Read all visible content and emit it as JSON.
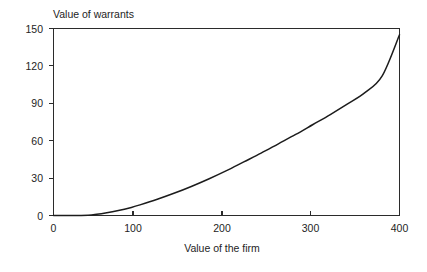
{
  "chart_data": {
    "type": "line",
    "title": "Value of warrants",
    "xlabel": "Value of the firm",
    "ylabel": "",
    "xlim": [
      0,
      400
    ],
    "ylim": [
      0,
      150
    ],
    "grid": false,
    "legend": null,
    "x_ticks": [
      0,
      100,
      200,
      300,
      400
    ],
    "x_tick_labels": [
      "0",
      "100",
      "200",
      "300",
      "400"
    ],
    "y_ticks": [
      0,
      30,
      60,
      90,
      120,
      150
    ],
    "y_tick_labels": [
      "0",
      "30",
      "60",
      "90",
      "120",
      "150"
    ],
    "series": [
      {
        "name": "Value of warrants",
        "color": "#1c1c1c",
        "x": [
          0,
          20,
          40,
          50,
          60,
          75,
          90,
          100,
          120,
          140,
          160,
          180,
          200,
          220,
          240,
          260,
          280,
          300,
          320,
          340,
          360,
          380,
          400
        ],
        "values": [
          0,
          0,
          0.3,
          1,
          2,
          4,
          6.5,
          8.5,
          13,
          18,
          23.5,
          29.5,
          36,
          43,
          50,
          57.5,
          65,
          73,
          81,
          89.5,
          98.5,
          112,
          145
        ]
      }
    ]
  },
  "labels": {
    "title": "Value of warrants",
    "xlabel": "Value of the firm",
    "y": [
      "150",
      "120",
      "90",
      "60",
      "30",
      "0"
    ],
    "x": [
      "0",
      "100",
      "200",
      "300",
      "400"
    ]
  }
}
